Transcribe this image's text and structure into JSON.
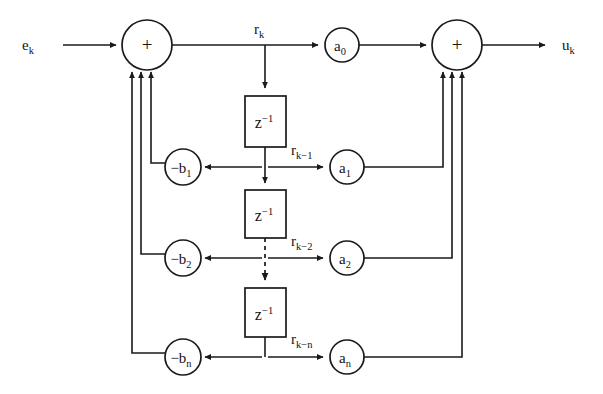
{
  "diagram": {
    "type": "signal-flow-block-diagram",
    "stroke_color": "#1a1a1a",
    "background_color": "#ffffff",
    "input_label": "e",
    "input_subscript": "k",
    "output_label": "u",
    "output_subscript": "k",
    "adders": [
      {
        "name": "input-adder",
        "symbol": "+",
        "cx": 147,
        "cy": 45,
        "r": 25
      },
      {
        "name": "output-adder",
        "symbol": "+",
        "cx": 457,
        "cy": 45,
        "r": 25
      }
    ],
    "feedforward_gains": [
      {
        "name": "a0",
        "base": "a",
        "sub": "0",
        "cx": 342,
        "cy": 45,
        "r": 17
      },
      {
        "name": "a1",
        "base": "a",
        "sub": "1",
        "cx": 347,
        "cy": 167,
        "r": 17
      },
      {
        "name": "a2",
        "base": "a",
        "sub": "2",
        "cx": 347,
        "cy": 258,
        "r": 17
      },
      {
        "name": "an",
        "base": "a",
        "sub": "n",
        "cx": 347,
        "cy": 357,
        "r": 17
      }
    ],
    "feedback_gains": [
      {
        "name": "-b1",
        "base": "−b",
        "sub": "1",
        "cx": 183,
        "cy": 167,
        "r": 18
      },
      {
        "name": "-b2",
        "base": "−b",
        "sub": "2",
        "cx": 183,
        "cy": 258,
        "r": 18
      },
      {
        "name": "-bn",
        "base": "−b",
        "sub": "n",
        "cx": 183,
        "cy": 357,
        "r": 18
      }
    ],
    "delay_blocks": [
      {
        "name": "delay-1",
        "label": "z",
        "exponent": "−1",
        "x": 245,
        "y": 96,
        "w": 41,
        "h": 51
      },
      {
        "name": "delay-2",
        "label": "z",
        "exponent": "−1",
        "x": 245,
        "y": 190,
        "w": 41,
        "h": 48
      },
      {
        "name": "delay-3",
        "label": "z",
        "exponent": "−1",
        "x": 245,
        "y": 288,
        "w": 41,
        "h": 49
      }
    ],
    "signal_labels": [
      {
        "name": "r_k",
        "base": "r",
        "sub": "k",
        "x": 254,
        "y": 34
      },
      {
        "name": "r_k-1",
        "base": "r",
        "sub": "k−1",
        "x": 291,
        "y": 155
      },
      {
        "name": "r_k-2",
        "base": "r",
        "sub": "k−2",
        "x": 291,
        "y": 246
      },
      {
        "name": "r_k-n",
        "base": "r",
        "sub": "k−n",
        "x": 291,
        "y": 344
      }
    ],
    "notes": {
      "ellipsis_style": "dashed vertical line between second and third delay blocks indicating omitted stages"
    }
  }
}
